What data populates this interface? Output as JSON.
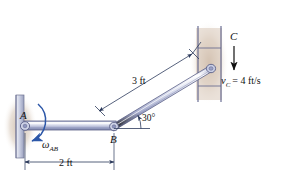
{
  "figure": {
    "type": "mechanism-kinematics-diagram",
    "background_color": "#ffffff",
    "width": 283,
    "height": 177
  },
  "labels": {
    "point_a": "A",
    "point_b": "B",
    "point_c": "C",
    "omega_ab_symbol": "ω",
    "omega_ab_subscript": "AB",
    "velocity_symbol": "v",
    "velocity_subscript": "C",
    "velocity_equation": "= 4 ft/s",
    "angle": "30°",
    "dim_ab": "2 ft",
    "dim_bc": "3 ft"
  },
  "colors": {
    "link_fill_light": "#e8eaf4",
    "link_fill_mid": "#b9bfdb",
    "link_fill_dark": "#8c93bb",
    "link_stroke": "#5a5f86",
    "wall_fill": "#cfd3e4",
    "wall_stroke": "#6e7392",
    "shadow_fill": "#cfbfb0",
    "slot_fill": "#d9c9ba",
    "accent_blue": "#2c57a8",
    "dim_line": "#3a4766",
    "text": "#111111"
  },
  "geometry": {
    "point_a": [
      26,
      126
    ],
    "point_b": [
      113,
      127
    ],
    "point_c": [
      214,
      68
    ],
    "angle_degrees": 30,
    "length_ab_ft": 2,
    "length_bc_ft": 3
  },
  "annotations": {
    "omega_direction": "counterclockwise-arrow-at-A",
    "velocity_direction": "downward-arrow-at-C",
    "slot_orientation": "vertical"
  }
}
